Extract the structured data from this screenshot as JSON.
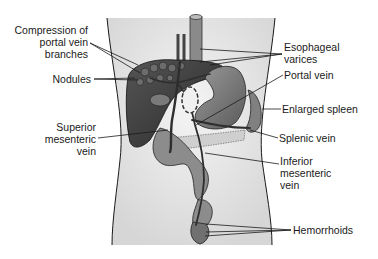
{
  "diagram": {
    "labels_left": {
      "compression_line1": "Compression of",
      "compression_line2": "portal vein",
      "compression_line3": "branches",
      "nodules": "Nodules",
      "smv_line1": "Superior",
      "smv_line2": "mesenteric",
      "smv_line3": "vein"
    },
    "labels_right": {
      "esophageal_line1": "Esophageal",
      "esophageal_line2": "varices",
      "portal_vein": "Portal vein",
      "spleen": "Enlarged spleen",
      "splenic_vein": "Splenic vein",
      "imv_line1": "Inferior",
      "imv_line2": "mesenteric",
      "imv_line3": "vein",
      "hemorrhoids": "Hemorrhoids"
    },
    "colors": {
      "organ_dark": "#3a3a3a",
      "organ_mid": "#7a7a7a",
      "organ_light": "#a8a8a8",
      "body_fill": "#e6e6e6",
      "line": "#1a1a1a"
    }
  }
}
